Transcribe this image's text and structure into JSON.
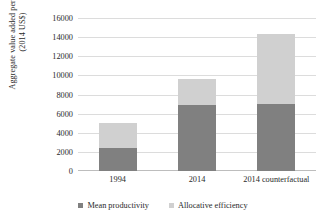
{
  "chart_data": {
    "type": "bar",
    "subtype": "stacked-vertical",
    "title": "",
    "xlabel": "",
    "ylabel": "Aggregate value added per worker (2014 US$)",
    "ylabel_lines": [
      "Aggregate value added per worker",
      "(2014 US$)"
    ],
    "categories": [
      "1994",
      "2014",
      "2014 counterfactual"
    ],
    "series": [
      {
        "name": "Mean productivity",
        "color": "#808080",
        "values": [
          2400,
          6900,
          7000
        ]
      },
      {
        "name": "Allocative efficiency",
        "color": "#d0d0d0",
        "values": [
          2600,
          2700,
          7300
        ]
      }
    ],
    "totals": [
      5000,
      9600,
      14300
    ],
    "ylim": [
      0,
      16000
    ],
    "ytick_step": 2000,
    "yticks": [
      "0",
      "2000",
      "4000",
      "6000",
      "8000",
      "10000",
      "12000",
      "14000",
      "16000"
    ],
    "ytick_values": [
      0,
      2000,
      4000,
      6000,
      8000,
      10000,
      12000,
      14000,
      16000
    ],
    "grid": true,
    "grid_color": "#dcdcdc",
    "legend_position": "bottom",
    "background": "#ffffff"
  }
}
